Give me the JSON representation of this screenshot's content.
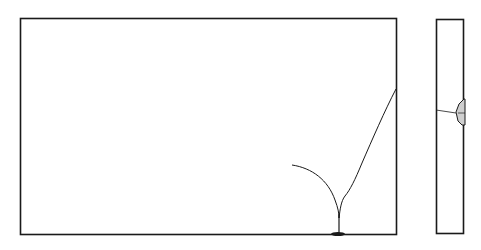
{
  "figure": {
    "views": [
      {
        "name": "front-view",
        "label": ""
      },
      {
        "name": "side-view",
        "label": ""
      }
    ],
    "colors": {
      "stroke": "#1a1a1a",
      "background": "#ffffff",
      "shade": "#888888"
    }
  }
}
